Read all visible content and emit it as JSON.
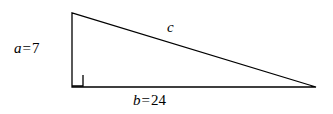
{
  "figure": {
    "background_color": "#ffffff",
    "stroke_color": "#000000",
    "stroke_width": 1.3,
    "width": 333,
    "height": 114
  },
  "labels": {
    "leg_a": {
      "variable": "a",
      "equals": "=",
      "value": "7",
      "full": "a = 7"
    },
    "leg_b": {
      "variable": "b",
      "equals": "=",
      "value": "24",
      "full": "b = 24"
    },
    "hypotenuse_c": {
      "variable": "c",
      "full": "c"
    }
  },
  "geometry": {
    "vertices": {
      "apex": {
        "x": 72,
        "y": 13
      },
      "right_angle": {
        "x": 72,
        "y": 87
      },
      "base_right": {
        "x": 316,
        "y": 87
      }
    },
    "right_angle_marker": {
      "x": 72,
      "y": 75,
      "size": 11
    },
    "polygon_points": "72,13 72,87 316,87"
  },
  "chart_data": {
    "type": "diagram",
    "shape": "right-triangle",
    "sides": [
      {
        "name": "a",
        "role": "vertical-leg",
        "value": 7,
        "label": "a = 7"
      },
      {
        "name": "b",
        "role": "horizontal-leg",
        "value": 24,
        "label": "b = 24"
      },
      {
        "name": "c",
        "role": "hypotenuse",
        "value": null,
        "label": "c"
      }
    ],
    "right_angle_at": "bottom-left vertex",
    "annotations": [
      "a = 7",
      "b = 24",
      "c"
    ]
  }
}
